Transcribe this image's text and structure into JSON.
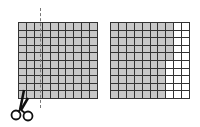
{
  "figure": {
    "left_grid": {
      "rows": 10,
      "cols": 10,
      "shaded_cells": 100,
      "cut_after_column": 3
    },
    "right_grid": {
      "rows": 10,
      "cols": 10,
      "shaded_full_columns": 7,
      "partial_column_shaded_rows": 5,
      "shaded_cells": 75
    },
    "colors": {
      "shaded": "#c8c8c8",
      "unshaded": "#ffffff",
      "gridline": "#333333",
      "cut_line": "#777777"
    },
    "icons": [
      "scissors-icon"
    ]
  }
}
